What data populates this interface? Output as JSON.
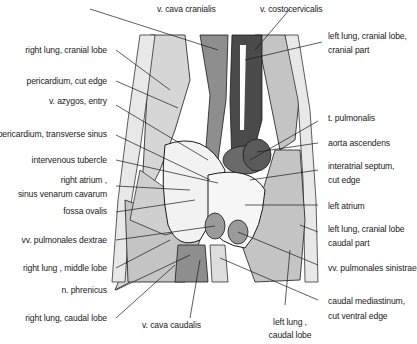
{
  "figure": {
    "colors": {
      "lung": "#c4c4c4",
      "lung_light": "#d6d6d6",
      "vessel_dark": "#4a4a4a",
      "vessel_mid": "#7a7a7a",
      "vein": "#8e8e8e",
      "heart_light": "#f2f2f2",
      "line": "#1a1a1a"
    }
  },
  "labels": {
    "top": {
      "v_cava_cranialis": "v. cava cranialis",
      "v_costocervicalis": "v. costocervicalis"
    },
    "left": [
      {
        "id": "right_lung_cranial_lobe",
        "text": "right lung, cranial lobe"
      },
      {
        "id": "pericardium_cut_edge",
        "text": "pericardium, cut edge"
      },
      {
        "id": "v_azygos_entry",
        "text": "v. azygos,   entry"
      },
      {
        "id": "pericardium_transverse_sinus",
        "text": "pericardium,  transverse sinus"
      },
      {
        "id": "intervenous_tubercle",
        "text": "intervenous tubercle"
      },
      {
        "id": "right_atrium_1",
        "text": "right atrium ,"
      },
      {
        "id": "right_atrium_2",
        "text": "sinus venarum cavarum"
      },
      {
        "id": "fossa_ovalis",
        "text": "fossa ovalis"
      },
      {
        "id": "vv_pulmonales_dextrae",
        "text": "vv. pulmonales dextrae"
      },
      {
        "id": "right_lung_middle_lobe",
        "text": "right lung ,  middle lobe"
      },
      {
        "id": "n_phrenicus",
        "text": "n. phrenicus"
      },
      {
        "id": "right_lung_caudal_lobe",
        "text": "right lung,  caudal lobe"
      }
    ],
    "right": [
      {
        "id": "left_lung_cranial_cranial_1",
        "text": "left lung,  cranial lobe,"
      },
      {
        "id": "left_lung_cranial_cranial_2",
        "text": "cranial part"
      },
      {
        "id": "t_pulmonalis",
        "text": "t.  pulmonalis"
      },
      {
        "id": "aorta_ascendens",
        "text": "aorta ascendens"
      },
      {
        "id": "interatrial_septum_1",
        "text": "interatrial septum,"
      },
      {
        "id": "interatrial_septum_2",
        "text": "cut edge"
      },
      {
        "id": "left_atrium",
        "text": "left atrium"
      },
      {
        "id": "left_lung_cranial_caudal_1",
        "text": "left lung,  cranial lobe"
      },
      {
        "id": "left_lung_cranial_caudal_2",
        "text": "caudal  part"
      },
      {
        "id": "vv_pulmonales_sinistrae",
        "text": "vv. pulmonales sinistrae"
      },
      {
        "id": "caudal_mediastinum_1",
        "text": "caudal mediastinum,"
      },
      {
        "id": "caudal_mediastinum_2",
        "text": "cut ventral edge"
      }
    ],
    "bottom": {
      "v_cava_caudalis": "v. cava caudalis",
      "left_lung_caudal_1": "left lung ,",
      "left_lung_caudal_2": "caudal lobe"
    }
  }
}
